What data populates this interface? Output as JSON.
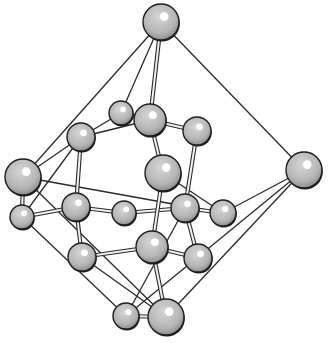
{
  "diagram": {
    "type": "crystal-structure-ball-and-stick",
    "colors": {
      "background": "#ffffff",
      "line": "#2a2a2a",
      "atom_fill": "#b8b8b8",
      "atom_rim": "#1e1e1e",
      "highlight": "#ffffff"
    },
    "atoms": [
      {
        "id": "a1",
        "x": 161,
        "y": 22,
        "r": 18
      },
      {
        "id": "a2",
        "x": 121,
        "y": 113,
        "r": 12
      },
      {
        "id": "a3",
        "x": 150,
        "y": 120,
        "r": 16
      },
      {
        "id": "a4",
        "x": 81,
        "y": 137,
        "r": 14
      },
      {
        "id": "a5",
        "x": 197,
        "y": 131,
        "r": 14
      },
      {
        "id": "a6",
        "x": 23,
        "y": 177,
        "r": 18
      },
      {
        "id": "a7",
        "x": 163,
        "y": 173,
        "r": 18
      },
      {
        "id": "a8",
        "x": 304,
        "y": 170,
        "r": 18
      },
      {
        "id": "a9",
        "x": 22,
        "y": 217,
        "r": 12
      },
      {
        "id": "a10",
        "x": 76,
        "y": 207,
        "r": 14
      },
      {
        "id": "a11",
        "x": 124,
        "y": 213,
        "r": 12
      },
      {
        "id": "a12",
        "x": 185,
        "y": 208,
        "r": 14
      },
      {
        "id": "a13",
        "x": 223,
        "y": 213,
        "r": 13
      },
      {
        "id": "a14",
        "x": 82,
        "y": 257,
        "r": 14
      },
      {
        "id": "a15",
        "x": 152,
        "y": 247,
        "r": 16
      },
      {
        "id": "a16",
        "x": 198,
        "y": 258,
        "r": 14
      },
      {
        "id": "a17",
        "x": 126,
        "y": 316,
        "r": 13
      },
      {
        "id": "a18",
        "x": 166,
        "y": 317,
        "r": 18
      }
    ],
    "thin_lines": [
      [
        "a1",
        "a6"
      ],
      [
        "a1",
        "a8"
      ],
      [
        "a1",
        "a2"
      ],
      [
        "a6",
        "a18"
      ],
      [
        "a8",
        "a17"
      ],
      [
        "a8",
        "a13"
      ],
      [
        "a8",
        "a18"
      ],
      [
        "a6",
        "a4"
      ],
      [
        "a6",
        "a13"
      ],
      [
        "a9",
        "a4"
      ],
      [
        "a9",
        "a17"
      ],
      [
        "a2",
        "a4"
      ],
      [
        "a4",
        "a3"
      ],
      [
        "a7",
        "a13"
      ],
      [
        "a12",
        "a17"
      ],
      [
        "a14",
        "a18"
      ]
    ],
    "bonds": [
      [
        "a1",
        "a3"
      ],
      [
        "a3",
        "a5"
      ],
      [
        "a3",
        "a7"
      ],
      [
        "a4",
        "a10"
      ],
      [
        "a5",
        "a12"
      ],
      [
        "a6",
        "a9"
      ],
      [
        "a9",
        "a10"
      ],
      [
        "a10",
        "a11"
      ],
      [
        "a11",
        "a12"
      ],
      [
        "a12",
        "a13"
      ],
      [
        "a7",
        "a15"
      ],
      [
        "a10",
        "a14"
      ],
      [
        "a14",
        "a15"
      ],
      [
        "a15",
        "a16"
      ],
      [
        "a12",
        "a16"
      ],
      [
        "a15",
        "a18"
      ],
      [
        "a17",
        "a18"
      ],
      [
        "a3",
        "a2"
      ]
    ]
  }
}
